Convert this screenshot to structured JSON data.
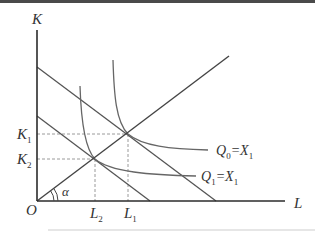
{
  "figure": {
    "type": "isoquant-isocost diagram (expansion path)",
    "axes": {
      "y_label": "K",
      "x_label": "L",
      "origin_label": "O"
    },
    "ticks": {
      "y": [
        {
          "label": "K",
          "sub": "1"
        },
        {
          "label": "K",
          "sub": "2"
        }
      ],
      "x": [
        {
          "label": "L",
          "sub": "2"
        },
        {
          "label": "L",
          "sub": "1"
        }
      ]
    },
    "angle_label": "α",
    "curves": [
      {
        "label_main": "Q",
        "label_sub": "0",
        "label_eq": "=X",
        "label_eq_sub": "1"
      },
      {
        "label_main": "Q",
        "label_sub": "1",
        "label_eq": "=X",
        "label_eq_sub": "1"
      }
    ],
    "colors": {
      "axis": "#2b2b2b",
      "curves": "#555555",
      "dashed": "#9a9a9a",
      "text": "#333333"
    }
  }
}
